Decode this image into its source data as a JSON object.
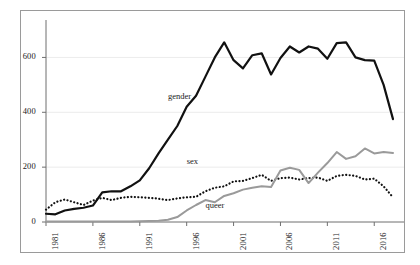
{
  "chart_data": {
    "type": "line",
    "title": "",
    "xlabel": "",
    "ylabel": "",
    "xlim": [
      1981,
      2018
    ],
    "ylim": [
      0,
      700
    ],
    "yticks": [
      0,
      200,
      400,
      600
    ],
    "ytick_labels": [
      "0",
      "200",
      "400",
      "600"
    ],
    "xticks": [
      1981,
      1986,
      1991,
      1996,
      2001,
      2006,
      2011,
      2016
    ],
    "xtick_labels": [
      "1981",
      "1986",
      "1991",
      "1996",
      "2001",
      "2006",
      "2011",
      "2016"
    ],
    "grid": true,
    "legend": "inline-annotations",
    "x": [
      1981,
      1982,
      1983,
      1984,
      1985,
      1986,
      1987,
      1988,
      1989,
      1990,
      1991,
      1992,
      1993,
      1994,
      1995,
      1996,
      1997,
      1998,
      1999,
      2000,
      2001,
      2002,
      2003,
      2004,
      2005,
      2006,
      2007,
      2008,
      2009,
      2010,
      2011,
      2012,
      2013,
      2014,
      2015,
      2016,
      2017,
      2018
    ],
    "series": [
      {
        "name": "gender",
        "style": "solid",
        "color": "#111111",
        "width": 2.2,
        "label_x": 1994,
        "label_y": 455,
        "values": [
          30,
          28,
          42,
          48,
          52,
          60,
          108,
          112,
          112,
          130,
          152,
          196,
          250,
          300,
          350,
          420,
          460,
          530,
          600,
          655,
          590,
          560,
          608,
          615,
          538,
          598,
          640,
          618,
          640,
          632,
          595,
          652,
          655,
          600,
          590,
          588,
          500,
          375
        ]
      },
      {
        "name": "sex",
        "style": "dotted",
        "color": "#111111",
        "width": 2.2,
        "label_x": 1996,
        "label_y": 218,
        "values": [
          45,
          72,
          82,
          72,
          62,
          78,
          88,
          80,
          88,
          92,
          90,
          88,
          85,
          80,
          86,
          90,
          92,
          112,
          125,
          130,
          148,
          150,
          160,
          172,
          150,
          160,
          162,
          155,
          160,
          162,
          150,
          168,
          172,
          168,
          155,
          158,
          130,
          90
        ]
      },
      {
        "name": "queer",
        "style": "solid",
        "color": "#9a9a9a",
        "width": 2.0,
        "label_x": 1998,
        "label_y": 60,
        "values": [
          2,
          2,
          2,
          2,
          2,
          2,
          2,
          2,
          2,
          2,
          3,
          4,
          5,
          8,
          18,
          42,
          62,
          80,
          72,
          95,
          105,
          118,
          125,
          130,
          128,
          188,
          198,
          190,
          142,
          180,
          215,
          255,
          230,
          240,
          268,
          250,
          255,
          252
        ]
      }
    ]
  },
  "axis": {
    "ytick_0": "0",
    "ytick_200": "200",
    "ytick_400": "400",
    "ytick_600": "600"
  }
}
